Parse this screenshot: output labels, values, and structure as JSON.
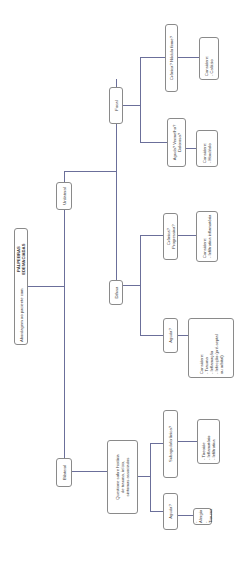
{
  "diagram": {
    "root": {
      "prefix": "Abordagem ao paciente com ",
      "emphasis": "PÁLPEBRAS EDEMACIADAS"
    },
    "unilateral": {
      "label": "Unilateral",
      "focal": {
        "label": "Focal",
        "aguda": {
          "label": "Aguda? Vermelha?\nDolorosa?",
          "considere": "Considere:\n- Hordéolo"
        },
        "cronica": {
          "label": "Crônica? Nódulo firme?",
          "considere": "Considere:\n- Calázio"
        }
      },
      "difusa": {
        "label": "Difusa",
        "aguda": {
          "label": "Aguda?",
          "considere": "Considere:\n- Trauma\n- Inflamação\n- Infecção (pré-septal\n  ou orbital)"
        },
        "cronica": {
          "label": "Crônica? Progressiva?",
          "considere": "Considere:\n- Infiltrativa inflamatória"
        }
      }
    },
    "bilateral": {
      "label": "Bilateral",
      "questione": "Questione sobre história\nde trauma, início,\nsintomas associados",
      "aguda": {
        "label": "Aguda?",
        "causes": "- Alergia\n- Trauma"
      },
      "subaguda": {
        "label": "Subaguda/crônica?",
        "causes": "- Tireoide\n- Inflamatório\n- Infiltrativa"
      }
    }
  },
  "colors": {
    "connector": "#6b6f9a",
    "box_border": "#8a8a8a",
    "text": "#3a3a3a",
    "background": "#ffffff"
  }
}
